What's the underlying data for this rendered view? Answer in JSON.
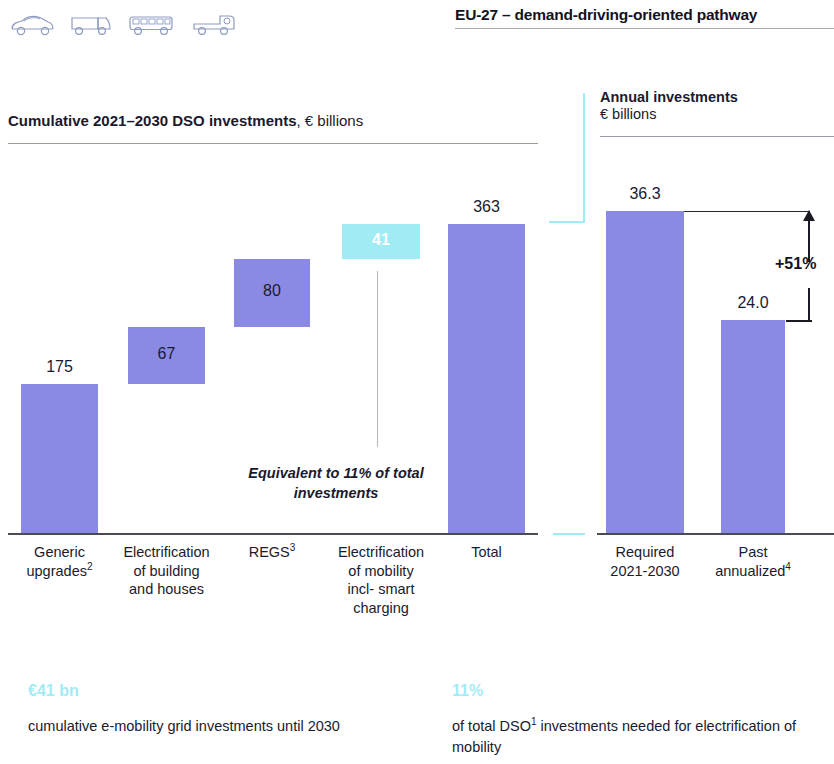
{
  "header": {
    "title": "EU-27 – demand-driving-oriented pathway",
    "icons": [
      "car-icon",
      "van-icon",
      "bus-icon",
      "truck-icon"
    ]
  },
  "left_panel": {
    "title_bold": "Cumulative 2021–2030 DSO investments",
    "title_rest": ", € billions"
  },
  "right_panel": {
    "title_bold": "Annual investments",
    "title_rest": "€ billions"
  },
  "annotations": {
    "equivalence_note": "Equivalent to 11% of total investments",
    "delta_label": "+51%"
  },
  "facts": [
    {
      "figure": "€41 bn",
      "text_before": "cumulative e-mobility grid investments until 2030",
      "sup": "",
      "text_after": ""
    },
    {
      "figure": "11%",
      "text_before": "of total DSO",
      "sup": "1",
      "text_after": " investments needed for electrification of mobility"
    }
  ],
  "chart_data": {
    "type": "bar",
    "title": "Cumulative 2021–2030 DSO investments, € billions",
    "xlabel": "",
    "ylabel": "€ billions",
    "grid": false,
    "legend": "none",
    "panels": [
      {
        "name": "Cumulative 2021-2030 DSO investments",
        "unit": "€ billions",
        "subtype": "waterfall",
        "categories": [
          "Generic upgrades2",
          "Electrification of building and houses",
          "REGS3",
          "Electrification of mobility incl- smart charging",
          "Total"
        ],
        "category_labels": [
          {
            "lines": [
              "Generic",
              "upgrades"
            ],
            "sup": "2"
          },
          {
            "lines": [
              "Electrification",
              "of building",
              "and houses"
            ],
            "sup": ""
          },
          {
            "lines": [
              "REGS"
            ],
            "sup": "3"
          },
          {
            "lines": [
              "Electrification",
              "of mobility",
              "incl- smart",
              "charging"
            ],
            "sup": ""
          },
          {
            "lines": [
              "Total"
            ],
            "sup": ""
          }
        ],
        "values": [
          175,
          67,
          80,
          41,
          363
        ],
        "value_labels": [
          "175",
          "67",
          "80",
          "41",
          "363"
        ],
        "cumulative_base": [
          0,
          175,
          242,
          322,
          0
        ],
        "highlight_index": 3,
        "highlight_color": "#9fecf5",
        "bar_color": "#8a8ae4",
        "ylim": [
          0,
          363
        ]
      },
      {
        "name": "Annual investments",
        "unit": "€ billions",
        "subtype": "bar",
        "categories": [
          "Required 2021-2030",
          "Past annualized4"
        ],
        "category_labels": [
          {
            "lines": [
              "Required",
              "2021-2030"
            ],
            "sup": ""
          },
          {
            "lines": [
              "Past",
              "annualized"
            ],
            "sup": "4"
          }
        ],
        "values": [
          36.3,
          24.0
        ],
        "value_labels": [
          "36.3",
          "24.0"
        ],
        "delta": "+51%",
        "bar_color": "#8a8ae4",
        "ylim": [
          0,
          36.3
        ]
      }
    ]
  }
}
